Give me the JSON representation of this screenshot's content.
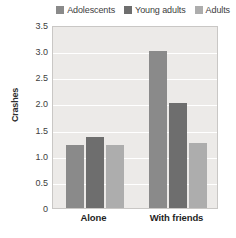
{
  "chart_data": {
    "type": "bar",
    "title": "",
    "xlabel": "",
    "ylabel": "Crashes",
    "categories": [
      "Alone",
      "With friends"
    ],
    "series": [
      {
        "name": "Adolescents",
        "color": "#8a8a8a",
        "values": [
          1.2,
          3.0
        ]
      },
      {
        "name": "Young adults",
        "color": "#6e6e6e",
        "values": [
          1.35,
          2.0
        ]
      },
      {
        "name": "Adults",
        "color": "#adadad",
        "values": [
          1.2,
          1.25
        ]
      }
    ],
    "ylim": [
      0,
      3.5
    ],
    "yticks": [
      "0",
      "0.5",
      "1.0",
      "1.5",
      "2.0",
      "2.5",
      "3.0",
      "3.5"
    ],
    "ytick_values": [
      0,
      0.5,
      1.0,
      1.5,
      2.0,
      2.5,
      3.0,
      3.5
    ],
    "grid": true,
    "legend_position": "top-right",
    "plot_background": "#eceae8",
    "gridline_color": "#ffffff",
    "plot_border_color": "#c9c7c5"
  }
}
